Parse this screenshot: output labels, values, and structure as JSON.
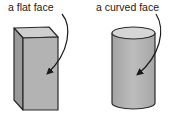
{
  "figure": {
    "labels": {
      "flat_face": "a flat face",
      "curved_face": "a curved face"
    },
    "shapes": [
      {
        "name": "rectangular prism",
        "annotation": "a flat face"
      },
      {
        "name": "cylinder",
        "annotation": "a curved face"
      }
    ],
    "colors": {
      "front_face": "#b3b3b3",
      "side_face": "#9a9a9a",
      "top_face": "#cfcfcf",
      "outline": "#2a2a2a",
      "cylinder_body": "#b0b0b0",
      "cylinder_top": "#d6d6d6"
    }
  }
}
